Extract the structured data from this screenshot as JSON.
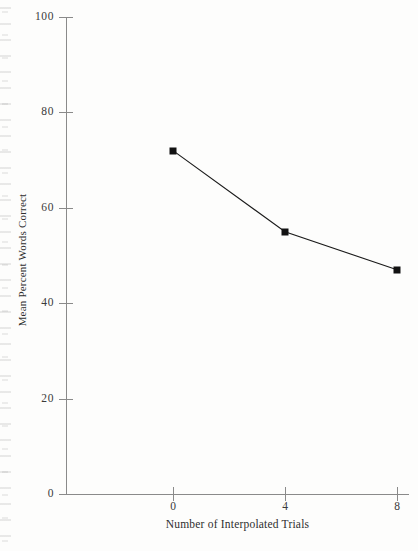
{
  "chart_data": {
    "type": "line",
    "title": "",
    "subtitle": "",
    "xlabel": "Number of Interpolated Trials",
    "ylabel": "Mean Percent Words Correct",
    "x": [
      0,
      4,
      8
    ],
    "values": [
      72,
      55,
      47
    ],
    "series": [
      {
        "name": "Mean Percent Words Correct",
        "x": [
          0,
          4,
          8
        ],
        "values": [
          72,
          55,
          47
        ]
      }
    ],
    "xlim": [
      -1.5,
      9
    ],
    "ylim": [
      0,
      100
    ],
    "xticks": [
      0,
      4,
      8
    ],
    "xtick_labels": [
      "0",
      "4",
      "8"
    ],
    "yticks": [
      0,
      20,
      40,
      60,
      80,
      100
    ],
    "ytick_labels": [
      "0",
      "20",
      "40",
      "60",
      "80",
      "100"
    ],
    "grid": false,
    "legend": false,
    "legend_position": "none",
    "marker": "filled-square",
    "line_color": "#1a1a1a",
    "marker_color": "#121212",
    "axis_color": "#8a8a8a",
    "background_color": "#fdfdfc",
    "annotations": []
  },
  "axes": {
    "y_title": "Mean Percent Words Correct",
    "x_title": "Number of Interpolated Trials"
  },
  "y_ticks": [
    {
      "label": "100",
      "value": 100
    },
    {
      "label": "80",
      "value": 80
    },
    {
      "label": "60",
      "value": 60
    },
    {
      "label": "40",
      "value": 40
    },
    {
      "label": "20",
      "value": 20
    },
    {
      "label": "0",
      "value": 0
    }
  ],
  "x_ticks": [
    {
      "label": "0",
      "value": 0
    },
    {
      "label": "4",
      "value": 4
    },
    {
      "label": "8",
      "value": 8
    }
  ],
  "points": [
    {
      "x": 0,
      "y": 72
    },
    {
      "x": 4,
      "y": 55
    },
    {
      "x": 8,
      "y": 47
    }
  ]
}
